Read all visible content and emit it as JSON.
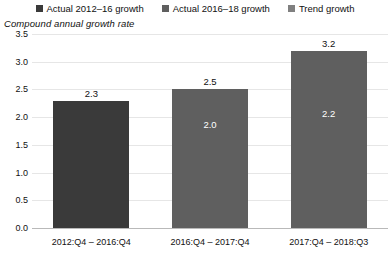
{
  "chart_data": {
    "type": "bar",
    "title": "",
    "subtitle": "Compound annual growth rate",
    "xlabel": "",
    "ylabel": "",
    "ylim": [
      0.0,
      3.5
    ],
    "yticks": [
      "0.0",
      "0.5",
      "1.0",
      "1.5",
      "2.0",
      "2.5",
      "3.0",
      "3.5"
    ],
    "grid": true,
    "legend_position": "top",
    "categories": [
      "2012:Q4 – 2016:Q4",
      "2016:Q4 – 2017:Q4",
      "2017:Q4 – 2018:Q3"
    ],
    "series": [
      {
        "name": "Actual 2012–16 growth",
        "color": "#3a3a3a",
        "values": [
          2.3,
          null,
          null
        ]
      },
      {
        "name": "Actual 2016–18 growth",
        "color": "#5f5f5f",
        "values": [
          null,
          2.5,
          3.2
        ]
      },
      {
        "name": "Trend growth",
        "color": "#808080",
        "values": [
          null,
          2.0,
          2.2
        ]
      }
    ],
    "bars": [
      {
        "category": "2012:Q4 – 2016:Q4",
        "value": 2.3,
        "top_label": "2.3",
        "inner_label": "",
        "color": "#3a3a3a"
      },
      {
        "category": "2016:Q4 – 2017:Q4",
        "value": 2.5,
        "top_label": "2.5",
        "inner_label": "2.0",
        "color": "#5f5f5f"
      },
      {
        "category": "2017:Q4 – 2018:Q3",
        "value": 3.2,
        "top_label": "3.2",
        "inner_label": "2.2",
        "color": "#5f5f5f"
      }
    ]
  },
  "legend": {
    "items": [
      {
        "label": "Actual 2012–16 growth",
        "color": "#3a3a3a"
      },
      {
        "label": "Actual 2016–18 growth",
        "color": "#5f5f5f"
      },
      {
        "label": "Trend growth",
        "color": "#808080"
      }
    ]
  },
  "subtitle": "Compound annual growth rate"
}
